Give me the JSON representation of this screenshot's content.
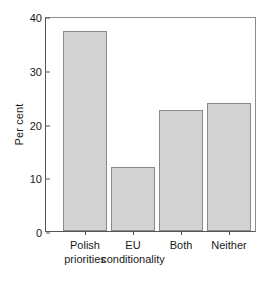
{
  "chart_data": {
    "type": "bar",
    "title": "",
    "subtitle": "",
    "xlabel": "",
    "ylabel": "Per cent",
    "categories": [
      "Polish priorities",
      "EU conditionality",
      "Both",
      "Neither"
    ],
    "category_lines": [
      [
        "Polish",
        "priorities"
      ],
      [
        "EU",
        "conditionality"
      ],
      [
        "Both",
        ""
      ],
      [
        "Neither",
        ""
      ]
    ],
    "values": [
      37.6,
      12.1,
      22.7,
      24.0
    ],
    "ylim": [
      0,
      40
    ],
    "yticks": [
      0,
      10,
      20,
      30,
      40
    ],
    "ytick_labels": [
      "0",
      "10",
      "20",
      "30",
      "40"
    ],
    "grid": false,
    "legend": "none",
    "bar_color": "#d2d2d2",
    "bar_edge_color": "#8a8a8a",
    "axis_color": "#555555",
    "background": "#ffffff"
  }
}
